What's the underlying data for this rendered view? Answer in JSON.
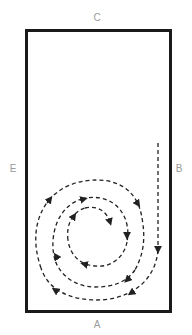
{
  "diagram": {
    "type": "dressage-arena-figure",
    "figure": "inward spiral with approach line",
    "markers": {
      "top": "C",
      "left": "E",
      "right": "B",
      "bottom": "A"
    },
    "colors": {
      "arena_border": "#1a1a1a",
      "path": "#222222",
      "marker_text": "#9a9a9a"
    },
    "path_style": "dashed",
    "direction": "clockwise spiral inward, entering down the right side"
  }
}
